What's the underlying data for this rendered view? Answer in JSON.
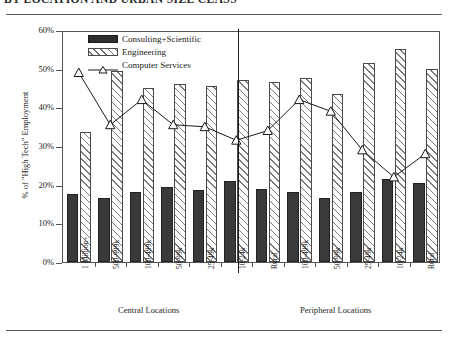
{
  "document": {
    "title_clipped": "BY LOCATION AND URBAN SIZE CLASS"
  },
  "chart_data": {
    "type": "bar",
    "title": "",
    "xlabel": "",
    "ylabel": "% of \"High Tech\" Employment",
    "ylim": [
      0,
      60
    ],
    "ytick_labels": [
      "0%",
      "10%",
      "20%",
      "30%",
      "40%",
      "50%",
      "60%"
    ],
    "ytick_values": [
      0,
      10,
      20,
      30,
      40,
      50,
      60
    ],
    "grid": false,
    "legend_position": "top-left-inside",
    "panels": [
      {
        "name": "Central Locations",
        "categories": [
          "1 Million+",
          "500-999k",
          "100-499k",
          "50-99k",
          "25-49k",
          "10-24k"
        ]
      },
      {
        "name": "Peripheral Locations",
        "categories": [
          "Rural",
          "100-499k",
          "50-99k",
          "25-49k",
          "10-24k",
          "Rural"
        ]
      }
    ],
    "categories": [
      "1 Million+",
      "500-999k",
      "100-499k",
      "50-99k",
      "25-49k",
      "10-24k",
      "Rural",
      "100-499k",
      "50-99k",
      "25-49k",
      "10-24k",
      "Rural"
    ],
    "series": [
      {
        "name": "Consulting+Scientific",
        "type": "bar",
        "style": "solid-black",
        "color": "#3a3a3a",
        "values": [
          17.5,
          16.5,
          18.0,
          19.5,
          18.5,
          21.0,
          19.0,
          18.0,
          16.5,
          18.0,
          21.5,
          20.5
        ]
      },
      {
        "name": "Engineering",
        "type": "bar",
        "style": "diagonal-hatch",
        "color": "#7a7a7a",
        "values": [
          33.5,
          49.5,
          45.0,
          46.0,
          45.5,
          47.0,
          46.5,
          47.5,
          43.5,
          51.5,
          55.0,
          50.0
        ]
      },
      {
        "name": "Computer Services",
        "type": "line",
        "marker": "triangle-up",
        "color": "#1a1a1a",
        "values": [
          49.5,
          36.0,
          42.5,
          36.0,
          35.5,
          32.0,
          34.5,
          42.5,
          39.5,
          29.5,
          22.5,
          28.5
        ]
      }
    ]
  },
  "legend": {
    "items": [
      {
        "label": "Consulting+Scientific",
        "key": "solid-bar"
      },
      {
        "label": "Engineering",
        "key": "hatched-bar"
      },
      {
        "label": "Computer Services",
        "key": "line-triangle"
      }
    ]
  }
}
